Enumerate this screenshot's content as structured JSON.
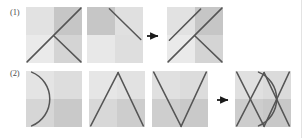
{
  "figure": {
    "caption_labels": {
      "row1": "(1)",
      "row2": "(2)"
    },
    "arrow_glyph": "→",
    "colors": {
      "stroke": "#555555",
      "arrow": "#1a1a1a",
      "quadrant_top_left": "#e2e2e2",
      "quadrant_top_right": "#c6c6c6",
      "quadrant_bottom_left": "#eaeaea",
      "quadrant_bottom_right": "#d4d4d4",
      "background": "#ffffff",
      "border": "#e3e3e3",
      "label_text": "#4d4d4d"
    },
    "panel_geometry": {
      "size": 56,
      "row1_top": 7,
      "row2_top": 71,
      "row1_lefts": [
        26,
        87,
        167
      ],
      "row2_lefts": [
        26,
        89,
        152,
        235
      ],
      "arrow_row1_x": 148,
      "arrow_row2_x": 218
    },
    "rows": [
      {
        "id": "row-1",
        "label": "(1)",
        "panels": [
          {
            "name": "panel-1-1",
            "description": "two crossing diagonal strokes forming an X-like figure",
            "shapes": [
              {
                "type": "line",
                "x1": 0.02,
                "y1": 0.98,
                "x2": 0.98,
                "y2": 0.02
              },
              {
                "type": "line",
                "x1": 0.5,
                "y1": 0.52,
                "x2": 0.98,
                "y2": 0.98
              }
            ]
          },
          {
            "name": "panel-1-2",
            "description": "single diagonal stroke from upper-left toward lower-right",
            "shapes": [
              {
                "type": "line",
                "x1": 0.4,
                "y1": 0.03,
                "x2": 0.96,
                "y2": 0.58
              }
            ]
          },
          {
            "name": "panel-1-3",
            "description": "overlay of both previous panels",
            "shapes": [
              {
                "type": "line",
                "x1": 0.02,
                "y1": 0.98,
                "x2": 0.98,
                "y2": 0.02
              },
              {
                "type": "line",
                "x1": 0.5,
                "y1": 0.52,
                "x2": 0.98,
                "y2": 0.98
              },
              {
                "type": "line",
                "x1": 0.04,
                "y1": 0.56,
                "x2": 0.6,
                "y2": 0.02
              }
            ]
          }
        ]
      },
      {
        "id": "row-2",
        "label": "(2)",
        "panels": [
          {
            "name": "panel-2-1",
            "description": "arc bulging to the right, anchored top-left and bottom-left",
            "shapes": [
              {
                "type": "arc",
                "x1": 0.1,
                "y1": 0.02,
                "x2": 0.1,
                "y2": 0.98,
                "rx": 0.52,
                "ry": 0.52
              }
            ]
          },
          {
            "name": "panel-2-2",
            "description": "lambda shape, peak at top center",
            "shapes": [
              {
                "type": "line",
                "x1": 0.03,
                "y1": 0.98,
                "x2": 0.52,
                "y2": 0.03
              },
              {
                "type": "line",
                "x1": 0.52,
                "y1": 0.03,
                "x2": 0.97,
                "y2": 0.98
              }
            ]
          },
          {
            "name": "panel-2-3",
            "description": "V shape, vertex at bottom center",
            "shapes": [
              {
                "type": "line",
                "x1": 0.03,
                "y1": 0.02,
                "x2": 0.52,
                "y2": 0.98
              },
              {
                "type": "line",
                "x1": 0.52,
                "y1": 0.98,
                "x2": 0.97,
                "y2": 0.02
              }
            ]
          },
          {
            "name": "panel-2-4",
            "description": "overlay of arc, lambda and V shapes",
            "shapes": [
              {
                "type": "line",
                "x1": 0.03,
                "y1": 0.98,
                "x2": 0.52,
                "y2": 0.03
              },
              {
                "type": "line",
                "x1": 0.52,
                "y1": 0.03,
                "x2": 0.97,
                "y2": 0.98
              },
              {
                "type": "line",
                "x1": 0.03,
                "y1": 0.02,
                "x2": 0.52,
                "y2": 0.98
              },
              {
                "type": "line",
                "x1": 0.52,
                "y1": 0.98,
                "x2": 0.97,
                "y2": 0.02
              },
              {
                "type": "arc",
                "x1": 0.42,
                "y1": 0.02,
                "x2": 0.42,
                "y2": 0.98,
                "rx": 0.52,
                "ry": 0.52
              }
            ]
          }
        ]
      }
    ],
    "arrows": [
      {
        "name": "arrow-row-1",
        "row": 1
      },
      {
        "name": "arrow-row-2",
        "row": 2
      }
    ]
  }
}
